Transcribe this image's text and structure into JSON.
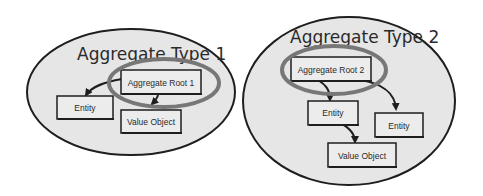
{
  "colors": {
    "background": "#ffffff",
    "aggregate_fill": "#e6e6e6",
    "outline": "#1e1e1e",
    "box_fill": "#ececec",
    "root_highlight_ring": "#777777"
  },
  "aggregates": [
    {
      "title": "Aggregate Type 1",
      "root": "Aggregate Root 1",
      "entities": [
        "Entity"
      ],
      "value_objects": [
        "Value Object"
      ]
    },
    {
      "title": "Aggregate Type 2",
      "root": "Aggregate Root 2",
      "entities": [
        "Entity",
        "Entity"
      ],
      "value_objects": [
        "Value Object"
      ]
    }
  ],
  "relations": [
    {
      "aggregate": 0,
      "from": "Aggregate Root 1",
      "to": "Entity"
    },
    {
      "aggregate": 0,
      "from": "Aggregate Root 1",
      "to": "Value Object"
    },
    {
      "aggregate": 1,
      "from": "Aggregate Root 2",
      "to": "Entity (left)"
    },
    {
      "aggregate": 1,
      "from": "Aggregate Root 2",
      "to": "Entity (right)"
    },
    {
      "aggregate": 1,
      "from": "Entity (left)",
      "to": "Value Object"
    }
  ]
}
